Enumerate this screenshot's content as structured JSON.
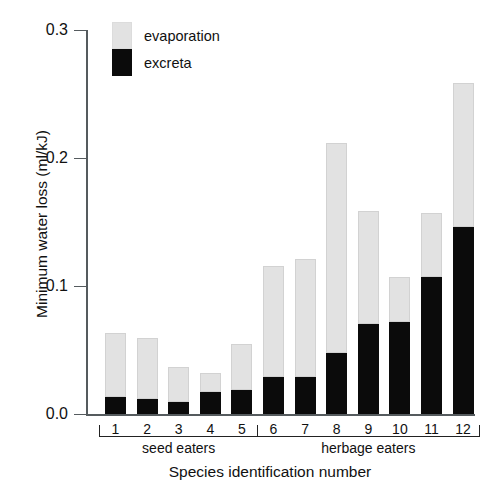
{
  "chart_data": {
    "type": "bar",
    "title": "",
    "subtitle": "",
    "xlabel": "Species identification number",
    "ylabel": "Minimum water loss (ml/kJ)",
    "ylim": [
      0.0,
      0.3
    ],
    "yticks": [
      "0.0",
      "0.1",
      "0.2",
      "0.3"
    ],
    "ytick_values": [
      0.0,
      0.1,
      0.2,
      0.3
    ],
    "grid": false,
    "stacked": true,
    "legend_position": "top-left",
    "legend": [
      "evaporation",
      "excreta"
    ],
    "categories": [
      "1",
      "2",
      "3",
      "4",
      "5",
      "6",
      "7",
      "8",
      "9",
      "10",
      "11",
      "12"
    ],
    "series": [
      {
        "name": "excreta",
        "color": "#0b0b0b",
        "values": [
          0.013,
          0.012,
          0.009,
          0.017,
          0.019,
          0.029,
          0.029,
          0.048,
          0.07,
          0.072,
          0.107,
          0.146
        ]
      },
      {
        "name": "evaporation",
        "color": "#e2e2e2",
        "values": [
          0.05,
          0.047,
          0.028,
          0.015,
          0.036,
          0.087,
          0.092,
          0.164,
          0.089,
          0.035,
          0.05,
          0.113
        ]
      }
    ],
    "totals": [
      0.063,
      0.059,
      0.037,
      0.032,
      0.055,
      0.116,
      0.121,
      0.212,
      0.159,
      0.107,
      0.157,
      0.259
    ],
    "groups": [
      {
        "label": "seed eaters",
        "from": 1,
        "to": 5
      },
      {
        "label": "herbage eaters",
        "from": 6,
        "to": 12
      }
    ],
    "annotations": []
  },
  "legend": {
    "items": [
      {
        "name": "evaporation",
        "label": "evaporation",
        "color": "#e2e2e2"
      },
      {
        "name": "excreta",
        "label": "excreta",
        "color": "#0b0b0b"
      }
    ]
  },
  "axes": {
    "y_title": "Minimum water loss (ml/kJ)",
    "x_title": "Species identification number",
    "y_tick_labels": [
      "0.3",
      "0.2",
      "0.1",
      "0.0"
    ],
    "x_tick_labels": [
      "1",
      "2",
      "3",
      "4",
      "5",
      "6",
      "7",
      "8",
      "9",
      "10",
      "11",
      "12"
    ]
  },
  "groups": {
    "seed_eaters": "seed eaters",
    "herbage_eaters": "herbage eaters"
  }
}
